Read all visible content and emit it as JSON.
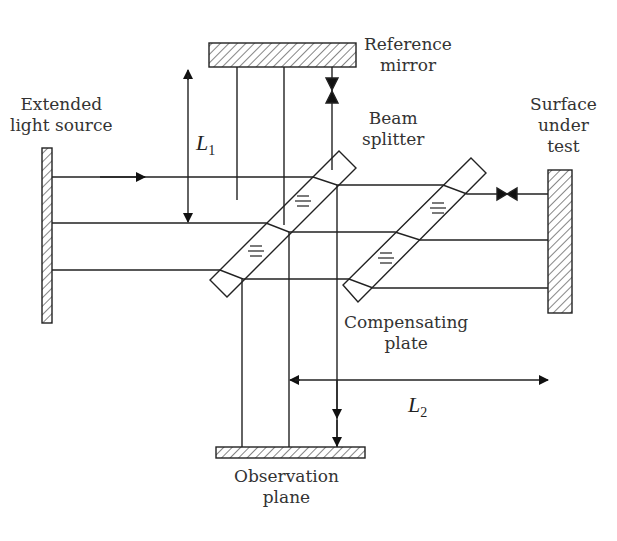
{
  "diagram": {
    "type": "Michelson/Twyman-Green interferometer schematic",
    "labels": {
      "reference_mirror": [
        "Reference",
        "mirror"
      ],
      "light_source": [
        "Extended",
        "light source"
      ],
      "beam_splitter": [
        "Beam",
        "splitter"
      ],
      "surface_under_test": [
        "Surface",
        "under",
        "test"
      ],
      "compensating_plate": [
        "Compensating",
        "plate"
      ],
      "observation_plane": [
        "Observation",
        "plane"
      ]
    },
    "symbols": {
      "L1": {
        "letter": "L",
        "sub": "1"
      },
      "L2": {
        "letter": "L",
        "sub": "2"
      }
    },
    "colors": {
      "line": "#222222",
      "text": "#333333"
    }
  }
}
